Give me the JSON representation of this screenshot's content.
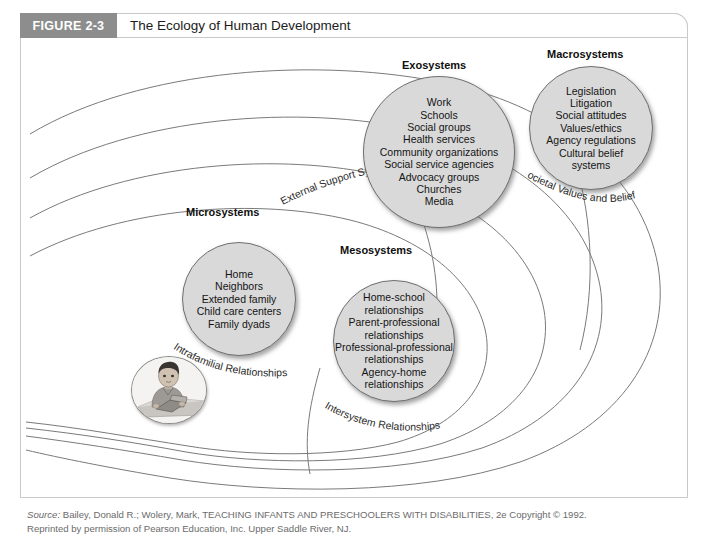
{
  "figure": {
    "number_label": "FIGURE 2-3",
    "title": "The Ecology of Human Development"
  },
  "systems": {
    "exosystems": {
      "heading": "Exosystems",
      "arc_label": "External Support Systems",
      "items": [
        "Work",
        "Schools",
        "Social groups",
        "Health services",
        "Community organizations",
        "Social service agencies",
        "Advocacy groups",
        "Churches",
        "Media"
      ]
    },
    "macrosystems": {
      "heading": "Macrosystems",
      "arc_label": "Societal Values and Beliefs",
      "items": [
        "Legislation",
        "Litigation",
        "Social attitudes",
        "Values/ethics",
        "Agency regulations",
        "Cultural belief",
        "systems"
      ]
    },
    "microsystems": {
      "heading": "Microsystems",
      "arc_label": "Intrafamilial Relationships",
      "items": [
        "Home",
        "Neighbors",
        "Extended family",
        "Child care centers",
        "Family dyads"
      ]
    },
    "mesosystems": {
      "heading": "Mesosystems",
      "arc_label": "Intersystem Relationships",
      "items": [
        "Home-school",
        "relationships",
        "Parent-professional",
        "relationships",
        "Professional-professional",
        "relationships",
        "Agency-home",
        "relationships"
      ]
    }
  },
  "child_photo": {
    "alt": "child-reading-book-photo"
  },
  "source": {
    "prefix": "Source:",
    "line1": " Bailey, Donald R.; Wolery, Mark, TEACHING INFANTS AND PRESCHOOLERS WITH DISABILITIES, 2e Copyright © 1992.",
    "line2": "Reprinted by permission of Pearson Education, Inc. Upper Saddle River, NJ."
  },
  "colors": {
    "header_bar": "#8d8d8d",
    "bubble_fill": "#d9d9d9",
    "bubble_stroke": "#6f6f6f",
    "arc_stroke": "#7a7a7a",
    "panel_border": "#c9c9c9",
    "caption_text": "#6b6b6b"
  }
}
